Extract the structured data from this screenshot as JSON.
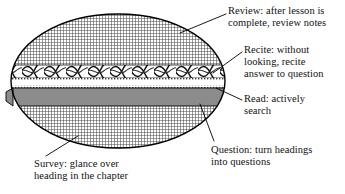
{
  "figure": {
    "shape": "ellipse",
    "colors": {
      "outline": "#000000",
      "crosshatch_fill": "#6b6b6b",
      "braid_band": "#1a1a1a",
      "white_band": "#ffffff",
      "solid_gray_band": "#8c8c8c",
      "dotted_band": "#555555",
      "text": "#111111",
      "leader_line": "#000000"
    },
    "layers": [
      {
        "name": "review-layer",
        "pattern": "crosshatch",
        "position": "top"
      },
      {
        "name": "recite-layer",
        "pattern": "braided-wave",
        "position": "upper-middle"
      },
      {
        "name": "read-layer",
        "pattern": "dotted-white",
        "position": "middle"
      },
      {
        "name": "question-layer",
        "pattern": "solid-gray",
        "position": "lower-middle"
      },
      {
        "name": "survey-layer",
        "pattern": "crosshatch",
        "position": "bottom"
      }
    ]
  },
  "labels": {
    "review": "Review: after lesson is\ncomplete, review notes",
    "recite": "Recite: without\nlooking, recite\nanswer to question",
    "read": "Read: actively\nsearch",
    "question": "Question: turn headings\ninto questions",
    "survey": "Survey: glance over\nheading in the chapter"
  },
  "leader_lines": [
    {
      "name": "leader-review",
      "from": [
        226,
        14
      ],
      "to": [
        180,
        33
      ]
    },
    {
      "name": "leader-recite",
      "from": [
        242,
        52
      ],
      "to": [
        213,
        73
      ]
    },
    {
      "name": "leader-read",
      "from": [
        242,
        100
      ],
      "to": [
        216,
        88
      ]
    },
    {
      "name": "leader-question",
      "from": [
        214,
        141
      ],
      "to": [
        200,
        104
      ]
    },
    {
      "name": "leader-survey",
      "from": [
        46,
        156
      ],
      "to": [
        78,
        136
      ]
    }
  ]
}
